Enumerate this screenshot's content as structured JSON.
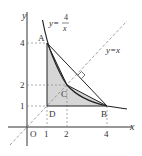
{
  "diagram": {
    "axes": {
      "x_label": "x",
      "y_label": "y",
      "origin_label": "O"
    },
    "x_ticks": [
      "1",
      "2",
      "4"
    ],
    "y_ticks": [
      "1",
      "2",
      "4"
    ],
    "curves": {
      "hyperbola_label_lhs": "y=",
      "hyperbola_num": "4",
      "hyperbola_den": "x",
      "line_label": "y=x"
    },
    "points": {
      "A": {
        "label": "A",
        "x": 1,
        "y": 4
      },
      "B": {
        "label": "B",
        "x": 4,
        "y": 1
      },
      "C": {
        "label": "C",
        "x": 2,
        "y": 2
      },
      "D": {
        "label": "D",
        "x": 1,
        "y": 1
      }
    },
    "colors": {
      "shade": "#d4d4d4",
      "line": "#333333",
      "dashed": "#777777"
    }
  }
}
